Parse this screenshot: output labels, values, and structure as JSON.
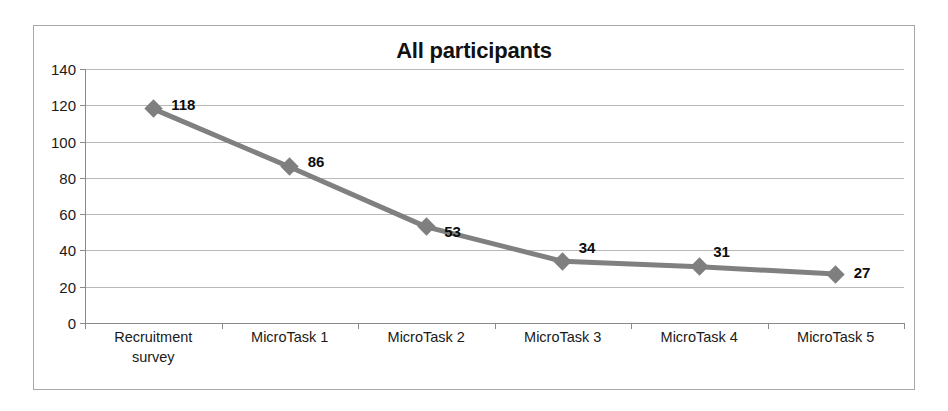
{
  "chart_data": {
    "type": "line",
    "title": "All participants",
    "xlabel": "",
    "ylabel": "",
    "categories": [
      "Recruitment\nsurvey",
      "MicroTask 1",
      "MicroTask 2",
      "MicroTask 3",
      "MicroTask 4",
      "MicroTask 5"
    ],
    "values": [
      118,
      86,
      53,
      34,
      31,
      27
    ],
    "data_labels": [
      "118",
      "86",
      "53",
      "34",
      "31",
      "27"
    ],
    "ylim": [
      0,
      140
    ],
    "ytick_labels": [
      "140",
      "120",
      "100",
      "80",
      "60",
      "40",
      "20",
      "0"
    ],
    "ytick_values": [
      140,
      120,
      100,
      80,
      60,
      40,
      20,
      0
    ],
    "grid": true,
    "legend": false,
    "marker": "diamond",
    "series": [
      {
        "name": "All participants",
        "values": [
          118,
          86,
          53,
          34,
          31,
          27
        ]
      }
    ]
  },
  "style": {
    "line_color": "#808080",
    "marker_color": "#7f7f7f",
    "grid_color": "#b9b9b9",
    "axis_color": "#8a8a8a",
    "border_color": "#a8a8a8",
    "text_color": "#1a1a1a",
    "background": "#ffffff"
  }
}
